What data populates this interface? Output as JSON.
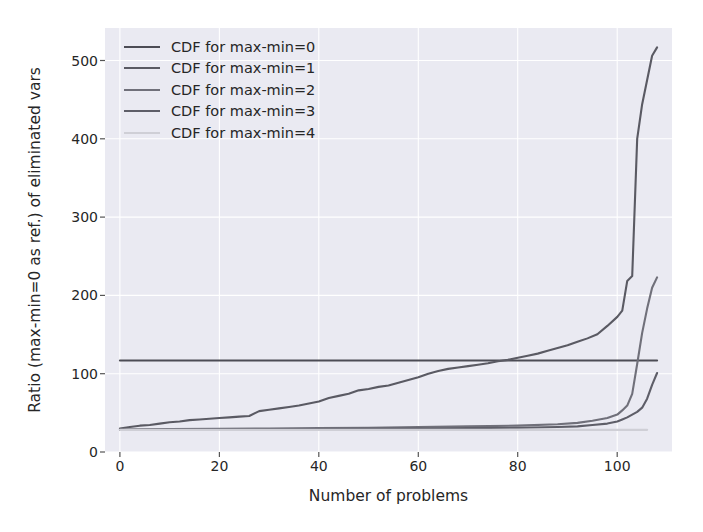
{
  "chart_data": {
    "type": "line",
    "title": "",
    "xlabel": "Number of problems",
    "ylabel": "Ratio (max-min=0 as ref.) of eliminated vars",
    "xlim": [
      -3,
      111
    ],
    "ylim": [
      -32,
      580
    ],
    "xticks": [
      0,
      20,
      40,
      60,
      80,
      100
    ],
    "yticks": [
      0,
      100,
      200,
      300,
      400,
      500
    ],
    "grid": true,
    "legend_position": "upper left",
    "legend_frame": false,
    "background": "#eaeaf2",
    "gridline_color": "#ffffff",
    "series": [
      {
        "name": "CDF for max-min=0",
        "color": "#4c4c55",
        "x": [
          0,
          108
        ],
        "values": [
          100,
          100
        ]
      },
      {
        "name": "CDF for max-min=1",
        "color": "#5a5a63",
        "x": [
          0,
          2,
          4,
          6,
          8,
          10,
          12,
          14,
          16,
          18,
          20,
          22,
          24,
          26,
          28,
          30,
          32,
          34,
          36,
          38,
          40,
          42,
          44,
          46,
          48,
          50,
          52,
          54,
          56,
          58,
          60,
          62,
          64,
          66,
          68,
          70,
          72,
          74,
          76,
          78,
          80,
          82,
          84,
          86,
          88,
          90,
          92,
          94,
          96,
          98,
          100,
          101,
          102,
          103,
          104,
          105,
          106,
          107,
          108
        ],
        "values": [
          2,
          4,
          6,
          7,
          9,
          11,
          12,
          14,
          15,
          16,
          17,
          18,
          19,
          20,
          27,
          29,
          31,
          33,
          35,
          38,
          41,
          46,
          49,
          52,
          57,
          59,
          62,
          64,
          68,
          72,
          76,
          81,
          85,
          88,
          90,
          92,
          94,
          96,
          99,
          101,
          104,
          107,
          110,
          114,
          118,
          122,
          127,
          132,
          138,
          150,
          163,
          172,
          215,
          222,
          420,
          470,
          505,
          540,
          552
        ]
      },
      {
        "name": "CDF for max-min=2",
        "color": "#70707a",
        "x": [
          0,
          10,
          20,
          30,
          40,
          50,
          60,
          70,
          80,
          88,
          92,
          95,
          98,
          100,
          101,
          102,
          103,
          104,
          105,
          106,
          107,
          108
        ],
        "values": [
          0.5,
          1,
          1.5,
          2,
          2.5,
          3,
          4,
          5,
          6,
          8,
          10,
          13,
          17,
          22,
          28,
          35,
          52,
          95,
          140,
          175,
          205,
          220
        ]
      },
      {
        "name": "CDF for max-min=3",
        "color": "#5e5e68",
        "x": [
          0,
          10,
          20,
          30,
          40,
          50,
          60,
          70,
          80,
          88,
          92,
          95,
          98,
          100,
          101,
          102,
          103,
          104,
          105,
          106,
          107,
          108
        ],
        "values": [
          0.2,
          0.5,
          0.8,
          1,
          1.3,
          1.6,
          2,
          2.5,
          3,
          4,
          5,
          7,
          9,
          12,
          15,
          18,
          22,
          26,
          32,
          45,
          65,
          82
        ]
      },
      {
        "name": "CDF for max-min=4",
        "color": "#cfcfd6",
        "x": [
          0,
          20,
          40,
          60,
          80,
          95,
          100,
          103,
          105,
          106
        ],
        "values": [
          0,
          0,
          0,
          0,
          0,
          0,
          0,
          0,
          0,
          0
        ]
      }
    ]
  }
}
